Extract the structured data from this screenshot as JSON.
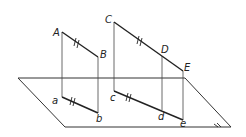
{
  "diagram": {
    "type": "orthogonal projection onto plane",
    "plane": {
      "points": [
        [
          18,
          78
        ],
        [
          185,
          78
        ],
        [
          231,
          127
        ],
        [
          65,
          127
        ]
      ]
    },
    "segments": [
      {
        "name": "AB",
        "from": "A",
        "to": "B",
        "equal_mark": "||"
      },
      {
        "name": "CDE",
        "from": "C",
        "to": "E",
        "via": "D",
        "equal_mark_on": "CD",
        "mark": "||"
      },
      {
        "name": "ab",
        "from": "a",
        "to": "b",
        "equal_mark": "||"
      },
      {
        "name": "cde",
        "from": "c",
        "to": "e",
        "via": "d",
        "equal_mark_on": "cd",
        "mark": "||"
      }
    ],
    "points": {
      "A": {
        "label": "A",
        "x": 62,
        "y": 32
      },
      "B": {
        "label": "B",
        "x": 98,
        "y": 57
      },
      "C": {
        "label": "C",
        "x": 114,
        "y": 22
      },
      "D": {
        "label": "D",
        "x": 162,
        "y": 56
      },
      "E": {
        "label": "E",
        "x": 183,
        "y": 71
      },
      "a": {
        "label": "a",
        "x": 62,
        "y": 97
      },
      "b": {
        "label": "b",
        "x": 98,
        "y": 113
      },
      "c": {
        "label": "c",
        "x": 114,
        "y": 91
      },
      "d": {
        "label": "d",
        "x": 162,
        "y": 110
      },
      "e": {
        "label": "e",
        "x": 183,
        "y": 120
      }
    }
  }
}
